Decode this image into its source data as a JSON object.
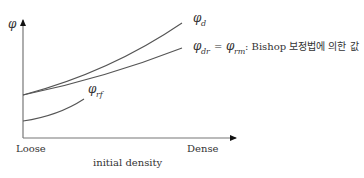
{
  "diagram": {
    "y_axis_label": "φ",
    "x_axis_start_label": "Loose",
    "x_axis_end_label": "Dense",
    "x_axis_title": "initial density",
    "curves": [
      {
        "id": "phi-d",
        "symbol": "φ",
        "subscript": "d"
      },
      {
        "id": "phi-dr",
        "symbol": "φ",
        "subscript": "dr",
        "equals_symbol": "φ",
        "equals_subscript": "rm",
        "note": ": Bishop 보정법에 의한 값"
      },
      {
        "id": "phi-rf",
        "symbol": "φ",
        "subscript": "rf"
      }
    ],
    "colors": {
      "line": "#555555",
      "text": "#333333",
      "axis": "#666666"
    }
  }
}
